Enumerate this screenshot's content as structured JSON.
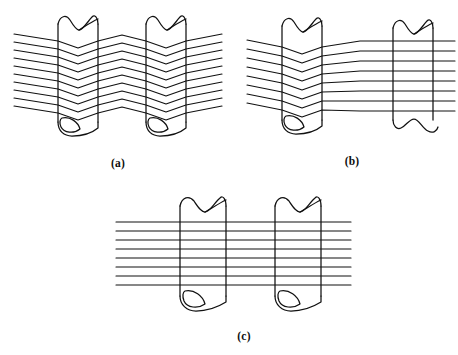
{
  "figure": {
    "title": "",
    "background_color": "#ffffff",
    "line_color": "#111111",
    "panels": [
      {
        "id": "a",
        "caption": "(a)",
        "caption_x": 118,
        "caption_y": 167,
        "state": "crimped",
        "description": "Fully crimped zigzag filaments passing through two tubes",
        "line_count": 10,
        "tube_count": 2,
        "region": {
          "x": 10,
          "y": 12,
          "width": 215,
          "height": 145
        },
        "lines_left_x": 14,
        "lines_right_x": 222,
        "line_top_y": 38,
        "line_spacing": 8.2,
        "zigzag_amplitude": 7.5,
        "tubes": [
          {
            "left": 58,
            "right": 98,
            "top": 16,
            "bottom": 132
          },
          {
            "left": 146,
            "right": 186,
            "top": 16,
            "bottom": 132
          }
        ]
      },
      {
        "id": "b",
        "caption": "(b)",
        "caption_x": 352,
        "caption_y": 165,
        "state": "partially-straightened",
        "description": "Left tube retains crimp, right tube filaments are straightened",
        "line_count": 8,
        "tube_count": 2,
        "region": {
          "x": 240,
          "y": 12,
          "width": 218,
          "height": 145
        },
        "lines_left_x": 247,
        "lines_right_x": 455,
        "line_top_y": 40,
        "line_spacing": 9.6,
        "zigzag_amplitude": 7.0,
        "tubes": [
          {
            "left": 282,
            "right": 322,
            "top": 18,
            "bottom": 130
          },
          {
            "left": 393,
            "right": 433,
            "top": 18,
            "bottom": 130
          }
        ]
      },
      {
        "id": "c",
        "caption": "(c)",
        "caption_x": 244,
        "caption_y": 340,
        "state": "fully-straightened",
        "description": "Both tubes with fully straight horizontal filaments",
        "line_count": 8,
        "tube_count": 2,
        "region": {
          "x": 110,
          "y": 190,
          "width": 240,
          "height": 140
        },
        "lines_left_x": 116,
        "lines_right_x": 351,
        "line_top_y": 222,
        "line_spacing": 9.6,
        "tubes": [
          {
            "left": 180,
            "right": 226,
            "top": 196,
            "bottom": 310
          },
          {
            "left": 275,
            "right": 321,
            "top": 196,
            "bottom": 310
          }
        ]
      }
    ]
  }
}
